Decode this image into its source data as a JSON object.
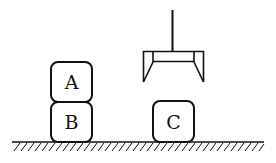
{
  "diagram": {
    "blocks": [
      {
        "id": "A",
        "label": "A",
        "x": 51,
        "y": 62,
        "w": 41,
        "h": 40
      },
      {
        "id": "B",
        "label": "B",
        "x": 51,
        "y": 102,
        "w": 41,
        "h": 40
      },
      {
        "id": "C",
        "label": "C",
        "x": 153,
        "y": 101,
        "w": 41,
        "h": 41
      }
    ],
    "gripper": {
      "rod_x": 172,
      "rod_top": 10,
      "bar_y": 51,
      "left_x": 143,
      "right_x": 204,
      "jaw_bottom": 82
    },
    "ground": {
      "y": 142,
      "x1": 12,
      "x2": 264
    },
    "colors": {
      "stroke": "#111111",
      "background": "#ffffff"
    }
  }
}
